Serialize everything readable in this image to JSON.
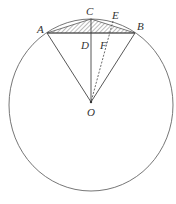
{
  "diagram": {
    "type": "circle-geometry",
    "points": {
      "A": {
        "label": "A",
        "x": 47,
        "y": 33
      },
      "B": {
        "label": "B",
        "x": 135,
        "y": 33
      },
      "C": {
        "label": "C",
        "x": 91,
        "y": 19
      },
      "D": {
        "label": "D",
        "x": 91,
        "y": 33
      },
      "E": {
        "label": "E",
        "x": 113,
        "y": 22
      },
      "F": {
        "label": "F",
        "x": 107,
        "y": 33
      },
      "O": {
        "label": "O",
        "x": 91,
        "y": 102
      }
    },
    "circle": {
      "cx": 91,
      "cy": 105,
      "rx": 82,
      "ry": 86
    },
    "segments": [
      "AB",
      "AO",
      "BO",
      "CO",
      "AC",
      "CB"
    ],
    "dashed_segments": [
      "EO"
    ],
    "shaded_region": "triangle ACB",
    "stroke_color": "#555555"
  }
}
